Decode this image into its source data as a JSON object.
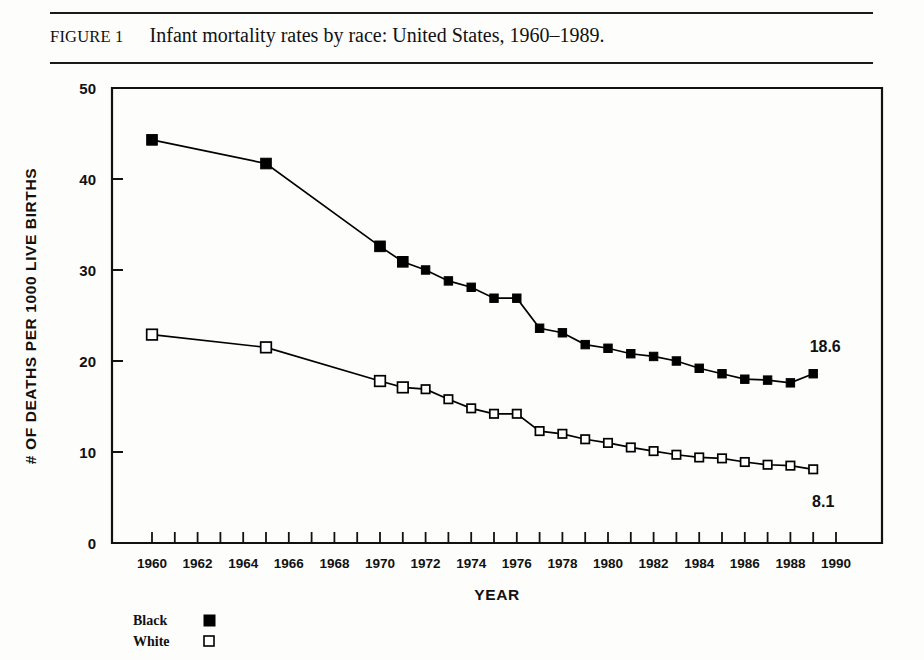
{
  "figure": {
    "number_label": "FIGURE 1",
    "caption": "Infant mortality rates by race: United States, 1960–1989."
  },
  "chart_data": {
    "type": "line",
    "title": "Infant mortality rates by race: United States, 1960–1989.",
    "xlabel": "YEAR",
    "ylabel": "# OF DEATHS PER 1000 LIVE BIRTHS",
    "xlim": [
      1959,
      1990
    ],
    "ylim": [
      0,
      50
    ],
    "x_ticks_all": [
      1960,
      1961,
      1962,
      1963,
      1964,
      1965,
      1966,
      1967,
      1968,
      1969,
      1970,
      1971,
      1972,
      1973,
      1974,
      1975,
      1976,
      1977,
      1978,
      1979,
      1980,
      1981,
      1982,
      1983,
      1984,
      1985,
      1986,
      1987,
      1988,
      1989,
      1990
    ],
    "x_tick_labels": [
      "1960",
      "1962",
      "1964",
      "1966",
      "1968",
      "1970",
      "1972",
      "1974",
      "1976",
      "1978",
      "1980",
      "1982",
      "1984",
      "1986",
      "1988",
      "1990"
    ],
    "x_tick_label_values": [
      1960,
      1962,
      1964,
      1966,
      1968,
      1970,
      1972,
      1974,
      1976,
      1978,
      1980,
      1982,
      1984,
      1986,
      1988,
      1990
    ],
    "y_ticks": [
      0,
      10,
      20,
      30,
      40,
      50
    ],
    "y_tick_labels": [
      "0",
      "10",
      "20",
      "30",
      "40",
      "50"
    ],
    "grid": false,
    "legend_position": "below-left",
    "series": [
      {
        "name": "Black",
        "marker": "filled-square",
        "color": "#000000",
        "x": [
          1960,
          1965,
          1970,
          1971,
          1972,
          1973,
          1974,
          1975,
          1976,
          1977,
          1978,
          1979,
          1980,
          1981,
          1982,
          1983,
          1984,
          1985,
          1986,
          1987,
          1988,
          1989
        ],
        "values": [
          44.3,
          41.7,
          32.6,
          30.9,
          30.0,
          28.8,
          28.1,
          26.9,
          26.9,
          23.6,
          23.1,
          21.8,
          21.4,
          20.8,
          20.5,
          20.0,
          19.2,
          18.6,
          18.0,
          17.9,
          17.6,
          18.6
        ]
      },
      {
        "name": "White",
        "marker": "open-square",
        "color": "#000000",
        "x": [
          1960,
          1965,
          1970,
          1971,
          1972,
          1973,
          1974,
          1975,
          1976,
          1977,
          1978,
          1979,
          1980,
          1981,
          1982,
          1983,
          1984,
          1985,
          1986,
          1987,
          1988,
          1989
        ],
        "values": [
          22.9,
          21.5,
          17.8,
          17.1,
          16.9,
          15.8,
          14.8,
          14.2,
          14.2,
          12.3,
          12.0,
          11.4,
          11.0,
          10.5,
          10.1,
          9.7,
          9.4,
          9.3,
          8.9,
          8.6,
          8.5,
          8.1
        ]
      }
    ],
    "annotations": [
      {
        "text": "18.6",
        "series": "Black",
        "x": 1989,
        "y": 18.6
      },
      {
        "text": "8.1",
        "series": "White",
        "x": 1989,
        "y": 8.1
      }
    ],
    "legend": [
      {
        "label": "Black",
        "marker": "filled-square"
      },
      {
        "label": "White",
        "marker": "open-square"
      }
    ]
  }
}
